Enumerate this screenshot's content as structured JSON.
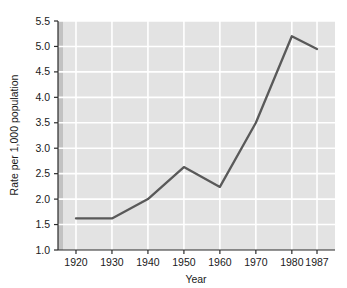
{
  "chart_data": {
    "type": "line",
    "title": "",
    "subtitle": "",
    "xlabel": "Year",
    "ylabel": "Rate per 1,000 population",
    "x": [
      1920,
      1930,
      1940,
      1950,
      1960,
      1970,
      1980,
      1987
    ],
    "xtick_labels": [
      "1920",
      "1930",
      "1940",
      "1950",
      "1960",
      "1970",
      "1980",
      "1987"
    ],
    "values": [
      1.62,
      1.62,
      2.0,
      2.63,
      2.24,
      3.5,
      5.2,
      4.95
    ],
    "ytick_labels": [
      "1.0",
      "1.5",
      "2.0",
      "2.5",
      "3.0",
      "3.5",
      "4.0",
      "4.5",
      "5.0",
      "5.5"
    ],
    "yticks": [
      1.0,
      1.5,
      2.0,
      2.5,
      3.0,
      3.5,
      4.0,
      4.5,
      5.0,
      5.5
    ],
    "ylim": [
      1.0,
      5.5
    ],
    "xlim": [
      1915,
      1992
    ],
    "grid": true,
    "legend": false,
    "legend_position": "none",
    "series": [
      {
        "name": "Rate per 1,000 population",
        "values": [
          1.62,
          1.62,
          2.0,
          2.63,
          2.24,
          3.5,
          5.2,
          4.95
        ]
      }
    ],
    "annotations": []
  },
  "style": {
    "plot_background": "#e3e3e3",
    "gridline_color": "#ffffff",
    "line_color": "#595959",
    "axis_color": "#2b2b2b",
    "text_color": "#1a1a1a",
    "page_background": "#ffffff",
    "left_edge_shade": "#c2c2c2"
  }
}
